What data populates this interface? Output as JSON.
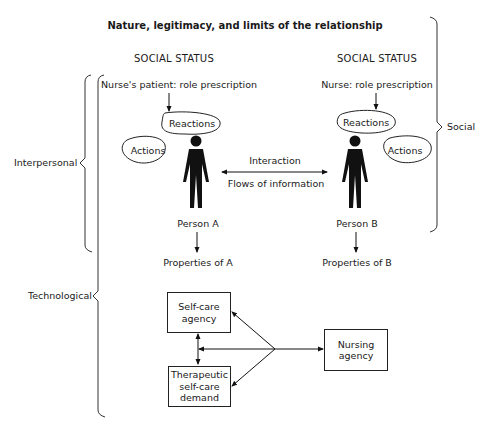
{
  "title": "Nature, legitimacy, and limits of the relationship",
  "left_column": {
    "status": "SOCIAL STATUS",
    "role": "Nurse's patient: role prescription",
    "reactions": "Reactions",
    "actions": "Actions",
    "person": "Person A",
    "properties": "Properties of A"
  },
  "right_column": {
    "status": "SOCIAL STATUS",
    "role": "Nurse: role prescription",
    "reactions": "Reactions",
    "actions": "Actions",
    "person": "Person B",
    "properties": "Properties of B"
  },
  "interaction": {
    "top": "Interaction",
    "bottom": "Flows of information"
  },
  "braces": {
    "social": "Social",
    "interpersonal": "Interpersonal",
    "technological": "Technological"
  },
  "boxes": {
    "self_care_agency": "Self-care\nagency",
    "therapeutic_demand": "Therapeutic\nself-care\ndemand",
    "nursing_agency": "Nursing\nagency"
  }
}
